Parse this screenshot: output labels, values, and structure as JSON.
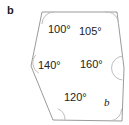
{
  "figure": {
    "part_label": "b",
    "shape_name": "hexagon",
    "stroke_color": "#9a9a9a",
    "arc_color": "#bdbdbd",
    "text_color": "#222222",
    "background_color": "#ffffff",
    "vertices": [
      {
        "name": "top-left",
        "x": 42,
        "y": 12
      },
      {
        "name": "top-right",
        "x": 117,
        "y": 12
      },
      {
        "name": "right-upper",
        "x": 124,
        "y": 68
      },
      {
        "name": "bottom-right",
        "x": 122,
        "y": 121
      },
      {
        "name": "bottom-left",
        "x": 53,
        "y": 120
      },
      {
        "name": "left-middle",
        "x": 31,
        "y": 66
      }
    ],
    "angles": [
      {
        "id": "angle-top-left",
        "value": "100",
        "label": "100°",
        "x": 48,
        "y": 24
      },
      {
        "id": "angle-top-right",
        "value": "105",
        "label": "105°",
        "x": 79,
        "y": 26
      },
      {
        "id": "angle-left-middle",
        "value": "140",
        "label": "140°",
        "x": 38,
        "y": 60
      },
      {
        "id": "angle-right-upper",
        "value": "160",
        "label": "160°",
        "x": 80,
        "y": 59
      },
      {
        "id": "angle-bottom-left",
        "value": "120",
        "label": "120°",
        "x": 64,
        "y": 92
      },
      {
        "id": "angle-unknown",
        "value": "b",
        "label": "b",
        "x": 104,
        "y": 97
      }
    ],
    "unknown_angle_label": "b"
  }
}
